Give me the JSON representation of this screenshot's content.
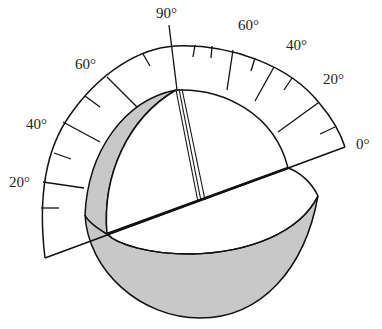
{
  "diagram": {
    "scale_labels": [
      {
        "text": "0°",
        "x": 356,
        "y": 137
      },
      {
        "text": "20°",
        "x": 323,
        "y": 72
      },
      {
        "text": "40°",
        "x": 286,
        "y": 38
      },
      {
        "text": "60°",
        "x": 238,
        "y": 18
      },
      {
        "text": "90°",
        "x": 156,
        "y": 6
      },
      {
        "text": "60°",
        "x": 75,
        "y": 57
      },
      {
        "text": "40°",
        "x": 26,
        "y": 117
      },
      {
        "text": "20°",
        "x": 9,
        "y": 175
      }
    ],
    "colors": {
      "line": "#111111",
      "shade": "#c8c8c8",
      "background": "#ffffff"
    }
  }
}
